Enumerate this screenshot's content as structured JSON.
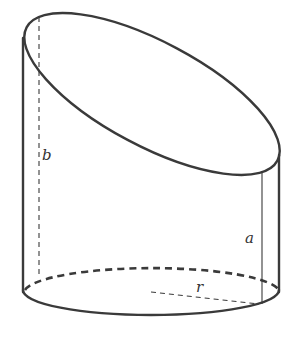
{
  "figure": {
    "labels": {
      "b": "b",
      "a": "a",
      "r": "r"
    },
    "colors": {
      "stroke": "#3a3a3a",
      "background": "#ffffff"
    }
  }
}
